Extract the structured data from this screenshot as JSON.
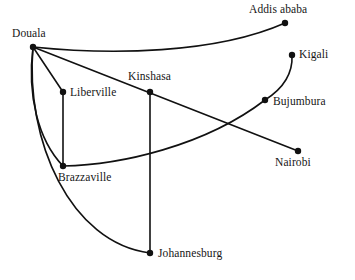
{
  "diagram": {
    "type": "node-link-graph",
    "canvas": {
      "width": 355,
      "height": 280,
      "background": "#ffffff"
    },
    "style": {
      "edge_color": "#111111",
      "node_color": "#111111",
      "label_color": "#161616",
      "edge_width": 1.6,
      "node_radius": 3.2
    }
  },
  "nodes": [
    {
      "id": "douala",
      "label": "Douala",
      "x": 33,
      "y": 47,
      "label_x": 12,
      "label_y": 28,
      "label_anchor": "above-left"
    },
    {
      "id": "addis_ababa",
      "label": "Addis ababa",
      "x": 285,
      "y": 23,
      "label_x": 249,
      "label_y": 4,
      "label_anchor": "above"
    },
    {
      "id": "kigali",
      "label": "Kigali",
      "x": 292,
      "y": 55,
      "label_x": 299,
      "label_y": 49,
      "label_anchor": "right"
    },
    {
      "id": "bujumbura",
      "label": "Bujumbura",
      "x": 265,
      "y": 100,
      "label_x": 273,
      "label_y": 96,
      "label_anchor": "right"
    },
    {
      "id": "nairobi",
      "label": "Nairobi",
      "x": 298,
      "y": 151,
      "label_x": 275,
      "label_y": 157,
      "label_anchor": "below"
    },
    {
      "id": "kinshasa",
      "label": "Kinshasa",
      "x": 150,
      "y": 92,
      "label_x": 128,
      "label_y": 71,
      "label_anchor": "above"
    },
    {
      "id": "liberville",
      "label": "Liberville",
      "x": 63,
      "y": 92,
      "label_x": 70,
      "label_y": 87,
      "label_anchor": "right"
    },
    {
      "id": "brazzaville",
      "label": "Brazzaville",
      "x": 63,
      "y": 166,
      "label_x": 58,
      "label_y": 172,
      "label_anchor": "below"
    },
    {
      "id": "johannesburg",
      "label": "Johannesburg",
      "x": 150,
      "y": 253,
      "label_x": 158,
      "label_y": 248,
      "label_anchor": "right"
    }
  ],
  "edges": [
    {
      "id": "douala-addis_ababa",
      "from": "Douala",
      "to": "Addis ababa",
      "shape": "curve",
      "path": "M33,47 C110,55 215,54 285,23"
    },
    {
      "id": "douala-liberville",
      "from": "Douala",
      "to": "Liberville",
      "shape": "line",
      "path": "M33,47 L63,92"
    },
    {
      "id": "douala-nairobi",
      "from": "Douala",
      "to": "Nairobi",
      "shape": "line",
      "path": "M33,47 L298,151"
    },
    {
      "id": "douala-brazzaville",
      "from": "Douala",
      "to": "Brazzaville",
      "shape": "curve",
      "path": "M33,47 C27,95 38,140 63,166"
    },
    {
      "id": "douala-johannesburg",
      "from": "Douala",
      "to": "Johannesburg",
      "shape": "curve",
      "path": "M33,47 C25,140 70,243 150,253"
    },
    {
      "id": "liberville-brazzaville",
      "from": "Liberville",
      "to": "Brazzaville",
      "shape": "line",
      "path": "M63,92 L63,166"
    },
    {
      "id": "kinshasa-johannesburg",
      "from": "Kinshasa",
      "to": "Johannesburg",
      "shape": "line",
      "path": "M150,92 L150,253"
    },
    {
      "id": "brazzaville-bujumbura",
      "from": "Brazzaville",
      "to": "Bujumbura",
      "shape": "curve",
      "path": "M63,166 C120,165 205,146 265,100"
    },
    {
      "id": "bujumbura-kigali",
      "from": "Bujumbura",
      "to": "Kigali",
      "shape": "curve",
      "path": "M265,100 C284,88 293,74 292,55"
    }
  ]
}
